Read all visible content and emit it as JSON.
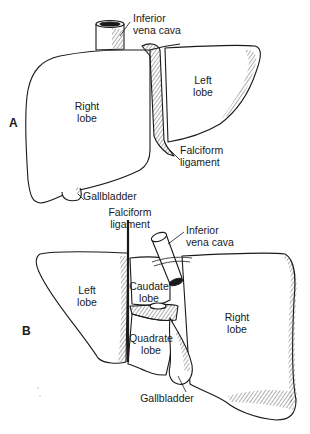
{
  "figure": {
    "panels": [
      {
        "letter": "A",
        "view": "anterior",
        "labels": {
          "ivc": "Inferior\nvena cava",
          "right_lobe": "Right\nlobe",
          "left_lobe": "Left\nlobe",
          "falciform": "Falciform\nligament",
          "gallbladder": "Gallbladder"
        }
      },
      {
        "letter": "B",
        "view": "visceral",
        "labels": {
          "falciform": "Falciform\nligament",
          "ivc": "Inferior\nvena cava",
          "left_lobe": "Left\nlobe",
          "caudate_lobe": "Caudate\nlobe",
          "quadrate_lobe": "Quadrate\nlobe",
          "right_lobe": "Right\nlobe",
          "gallbladder": "Gallbladder"
        }
      }
    ],
    "colors": {
      "ink": "#1a1a1a",
      "paper": "#ffffff"
    }
  }
}
